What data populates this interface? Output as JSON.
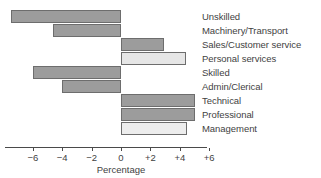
{
  "chart_data": {
    "type": "bar",
    "orientation": "horizontal",
    "title": "",
    "xlabel": "Percentage",
    "ylabel": "",
    "xlim": [
      -8,
      6
    ],
    "grid": false,
    "legend": null,
    "axis": {
      "tick_labels": [
        "−6",
        "−4",
        "−2",
        "0",
        "+2",
        "+4",
        "+6"
      ],
      "tick_values": [
        -6,
        -4,
        -2,
        0,
        2,
        4,
        6
      ],
      "zero_value": 0
    },
    "categories": [
      "Unskilled",
      "Machinery/Transport",
      "Sales/Customer service",
      "Personal services",
      "Skilled",
      "Admin/Clerical",
      "Technical",
      "Professional",
      "Management"
    ],
    "values": [
      -7.5,
      -4.6,
      2.9,
      4.4,
      -6.0,
      -4.0,
      5.0,
      5.0,
      4.5
    ],
    "bar_fills": [
      "#9c9c9c",
      "#9c9c9c",
      "#9c9c9c",
      "#e6e6e6",
      "#9c9c9c",
      "#9c9c9c",
      "#9c9c9c",
      "#9c9c9c",
      "#ededed"
    ],
    "bar_stroke": "#6d6d6d"
  },
  "colors": {
    "background": "#ffffff",
    "text": "#3f3f3f",
    "axis": "#4a4a4a",
    "bar_dark": "#9c9c9c",
    "bar_light": "#e6e6e6"
  }
}
